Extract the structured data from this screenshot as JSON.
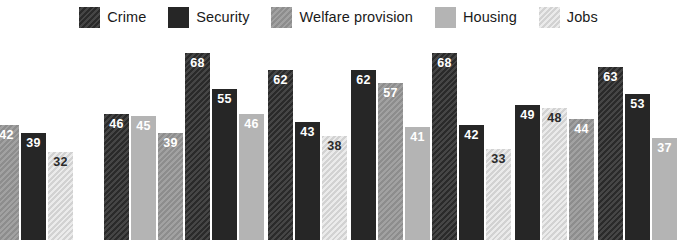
{
  "chart_data": {
    "type": "bar",
    "title": "",
    "subtitle": "",
    "xlabel": "",
    "ylabel": "",
    "grid": false,
    "legend_position": "top",
    "ylim": [
      0,
      75
    ],
    "categories": [
      "Group 1",
      "Group 2",
      "Group 3",
      "Group 4",
      "Group 5",
      "Group 6",
      "Group 7",
      "Group 8"
    ],
    "legend": [
      "Crime",
      "Security",
      "Welfare provision",
      "Housing",
      "Jobs"
    ],
    "series": [
      {
        "name": "Crime",
        "values": [
          null,
          46,
          68,
          62,
          null,
          68,
          null,
          63
        ]
      },
      {
        "name": "Security",
        "values": [
          39,
          null,
          55,
          43,
          62,
          42,
          49,
          53
        ]
      },
      {
        "name": "Welfare provision",
        "values": [
          42,
          39,
          null,
          null,
          57,
          null,
          44,
          null
        ]
      },
      {
        "name": "Housing",
        "values": [
          null,
          45,
          46,
          null,
          41,
          null,
          null,
          37
        ]
      },
      {
        "name": "Jobs",
        "values": [
          32,
          null,
          null,
          38,
          null,
          33,
          48,
          null
        ]
      }
    ],
    "groups": [
      {
        "name": "Group 1",
        "bars": [
          {
            "label": "42",
            "value": 42,
            "series": "Welfare provision"
          },
          {
            "label": "39",
            "value": 39,
            "series": "Security"
          },
          {
            "label": "32",
            "value": 32,
            "series": "Jobs"
          }
        ]
      },
      {
        "name": "Group 2",
        "bars": [
          {
            "label": "46",
            "value": 46,
            "series": "Crime"
          },
          {
            "label": "45",
            "value": 45,
            "series": "Housing"
          },
          {
            "label": "39",
            "value": 39,
            "series": "Welfare provision"
          }
        ]
      },
      {
        "name": "Group 3",
        "bars": [
          {
            "label": "68",
            "value": 68,
            "series": "Crime"
          },
          {
            "label": "55",
            "value": 55,
            "series": "Security"
          },
          {
            "label": "46",
            "value": 46,
            "series": "Housing"
          }
        ]
      },
      {
        "name": "Group 4",
        "bars": [
          {
            "label": "62",
            "value": 62,
            "series": "Crime"
          },
          {
            "label": "43",
            "value": 43,
            "series": "Security"
          },
          {
            "label": "38",
            "value": 38,
            "series": "Jobs"
          }
        ]
      },
      {
        "name": "Group 5",
        "bars": [
          {
            "label": "62",
            "value": 62,
            "series": "Security"
          },
          {
            "label": "57",
            "value": 57,
            "series": "Welfare provision"
          },
          {
            "label": "41",
            "value": 41,
            "series": "Housing"
          }
        ]
      },
      {
        "name": "Group 6",
        "bars": [
          {
            "label": "68",
            "value": 68,
            "series": "Crime"
          },
          {
            "label": "42",
            "value": 42,
            "series": "Security"
          },
          {
            "label": "33",
            "value": 33,
            "series": "Jobs"
          }
        ]
      },
      {
        "name": "Group 7",
        "bars": [
          {
            "label": "49",
            "value": 49,
            "series": "Security"
          },
          {
            "label": "48",
            "value": 48,
            "series": "Jobs"
          },
          {
            "label": "44",
            "value": 44,
            "series": "Welfare provision"
          }
        ]
      },
      {
        "name": "Group 8",
        "bars": [
          {
            "label": "63",
            "value": 63,
            "series": "Crime"
          },
          {
            "label": "53",
            "value": 53,
            "series": "Security"
          },
          {
            "label": "37",
            "value": 37,
            "series": "Housing"
          }
        ]
      }
    ]
  },
  "legend": {
    "items": [
      {
        "label": "Crime",
        "swatch": "crime-swatch",
        "color": "#2a2a2a"
      },
      {
        "label": "Security",
        "swatch": "security-swatch",
        "color": "#262626"
      },
      {
        "label": "Welfare provision",
        "swatch": "welfare-swatch",
        "color": "#8d8d8d"
      },
      {
        "label": "Housing",
        "swatch": "housing-swatch",
        "color": "#b4b4b4"
      },
      {
        "label": "Jobs",
        "swatch": "jobs-swatch",
        "color": "#d2d2d2"
      }
    ]
  }
}
